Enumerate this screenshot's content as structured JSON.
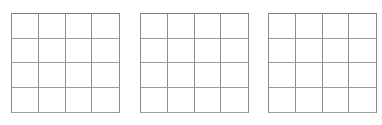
{
  "figure": {
    "title": "",
    "background_color": "#ffffff"
  },
  "style": {
    "line_color": "#8d8d8d",
    "border_color": "#7a7a7a",
    "cell_fill": "#ffffff",
    "line_width_px": 1
  },
  "grids": [
    {
      "id": "grid-1",
      "label": "",
      "rows": 4,
      "columns": 4,
      "cell_count": 16,
      "cells": [
        {
          "row": 1,
          "col": 1,
          "value": ""
        },
        {
          "row": 1,
          "col": 2,
          "value": ""
        },
        {
          "row": 1,
          "col": 3,
          "value": ""
        },
        {
          "row": 1,
          "col": 4,
          "value": ""
        },
        {
          "row": 2,
          "col": 1,
          "value": ""
        },
        {
          "row": 2,
          "col": 2,
          "value": ""
        },
        {
          "row": 2,
          "col": 3,
          "value": ""
        },
        {
          "row": 2,
          "col": 4,
          "value": ""
        },
        {
          "row": 3,
          "col": 1,
          "value": ""
        },
        {
          "row": 3,
          "col": 2,
          "value": ""
        },
        {
          "row": 3,
          "col": 3,
          "value": ""
        },
        {
          "row": 3,
          "col": 4,
          "value": ""
        },
        {
          "row": 4,
          "col": 1,
          "value": ""
        },
        {
          "row": 4,
          "col": 2,
          "value": ""
        },
        {
          "row": 4,
          "col": 3,
          "value": ""
        },
        {
          "row": 4,
          "col": 4,
          "value": ""
        }
      ]
    },
    {
      "id": "grid-2",
      "label": "",
      "rows": 4,
      "columns": 4,
      "cell_count": 16,
      "cells": [
        {
          "row": 1,
          "col": 1,
          "value": ""
        },
        {
          "row": 1,
          "col": 2,
          "value": ""
        },
        {
          "row": 1,
          "col": 3,
          "value": ""
        },
        {
          "row": 1,
          "col": 4,
          "value": ""
        },
        {
          "row": 2,
          "col": 1,
          "value": ""
        },
        {
          "row": 2,
          "col": 2,
          "value": ""
        },
        {
          "row": 2,
          "col": 3,
          "value": ""
        },
        {
          "row": 2,
          "col": 4,
          "value": ""
        },
        {
          "row": 3,
          "col": 1,
          "value": ""
        },
        {
          "row": 3,
          "col": 2,
          "value": ""
        },
        {
          "row": 3,
          "col": 3,
          "value": ""
        },
        {
          "row": 3,
          "col": 4,
          "value": ""
        },
        {
          "row": 4,
          "col": 1,
          "value": ""
        },
        {
          "row": 4,
          "col": 2,
          "value": ""
        },
        {
          "row": 4,
          "col": 3,
          "value": ""
        },
        {
          "row": 4,
          "col": 4,
          "value": ""
        }
      ]
    },
    {
      "id": "grid-3",
      "label": "",
      "rows": 4,
      "columns": 4,
      "cell_count": 16,
      "cells": [
        {
          "row": 1,
          "col": 1,
          "value": ""
        },
        {
          "row": 1,
          "col": 2,
          "value": ""
        },
        {
          "row": 1,
          "col": 3,
          "value": ""
        },
        {
          "row": 1,
          "col": 4,
          "value": ""
        },
        {
          "row": 2,
          "col": 1,
          "value": ""
        },
        {
          "row": 2,
          "col": 2,
          "value": ""
        },
        {
          "row": 2,
          "col": 3,
          "value": ""
        },
        {
          "row": 2,
          "col": 4,
          "value": ""
        },
        {
          "row": 3,
          "col": 1,
          "value": ""
        },
        {
          "row": 3,
          "col": 2,
          "value": ""
        },
        {
          "row": 3,
          "col": 3,
          "value": ""
        },
        {
          "row": 3,
          "col": 4,
          "value": ""
        },
        {
          "row": 4,
          "col": 1,
          "value": ""
        },
        {
          "row": 4,
          "col": 2,
          "value": ""
        },
        {
          "row": 4,
          "col": 3,
          "value": ""
        },
        {
          "row": 4,
          "col": 4,
          "value": ""
        }
      ]
    }
  ]
}
